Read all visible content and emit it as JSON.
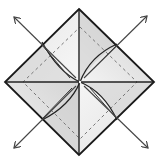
{
  "diagram": {
    "type": "origami-fold-step",
    "colors": {
      "background": "#ffffff",
      "paper_light": "#f2f2f2",
      "paper_mid": "#d9d9d9",
      "paper_dark": "#bdbdbd",
      "line": "#222222",
      "arrow": "#444444",
      "dashed": "#777777"
    },
    "outline": {
      "top": [
        79,
        9
      ],
      "right": [
        154,
        82
      ],
      "bottom": [
        79,
        155
      ],
      "left": [
        5,
        82
      ]
    },
    "center": [
      80,
      82
    ],
    "dashed_diamond": {
      "top": [
        80,
        27
      ],
      "right": [
        137,
        82
      ],
      "bottom": [
        80,
        139
      ],
      "left": [
        23,
        82
      ]
    },
    "arrows": [
      {
        "name": "arrow-top-left",
        "from": [
          74,
          76
        ],
        "to": [
          14,
          17
        ]
      },
      {
        "name": "arrow-top-right",
        "from": [
          86,
          76
        ],
        "to": [
          147,
          16
        ]
      },
      {
        "name": "arrow-bottom-left",
        "from": [
          74,
          88
        ],
        "to": [
          14,
          148
        ]
      },
      {
        "name": "arrow-bottom-right",
        "from": [
          86,
          88
        ],
        "to": [
          148,
          148
        ]
      }
    ]
  }
}
